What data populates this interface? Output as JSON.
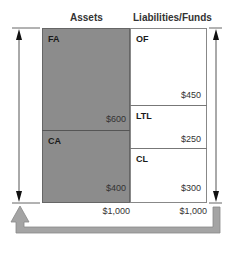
{
  "headers": {
    "assets": "Assets",
    "liabilities": "Liabilities/Funds"
  },
  "assets": [
    {
      "label": "FA",
      "value": "$600"
    },
    {
      "label": "CA",
      "value": "$400"
    }
  ],
  "liabilities": [
    {
      "label": "OF",
      "value": "$450"
    },
    {
      "label": "LTL",
      "value": "$250"
    },
    {
      "label": "CL",
      "value": "$300"
    }
  ],
  "totals": {
    "assets": "$1,000",
    "liabilities": "$1,000"
  },
  "colors": {
    "assets_fill": "#8c8c8c",
    "return_arrow": "#a0a0a0",
    "border": "#777777"
  },
  "icons": {
    "left_arrow": "double-headed-vertical-arrow",
    "right_arrow": "double-headed-vertical-arrow",
    "return_arrow": "u-turn-arrow"
  }
}
